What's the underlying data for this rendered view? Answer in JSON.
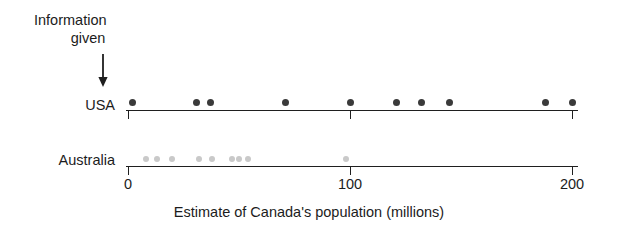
{
  "annotation": {
    "line1": "Information",
    "line2": "given",
    "arrow": "down-arrow",
    "points_to_value": 0
  },
  "rows": [
    {
      "label": "USA"
    },
    {
      "label": "Australia"
    }
  ],
  "axis": {
    "title": "Estimate of Canada's population (millions)",
    "ticks": [
      {
        "value": 0,
        "label": "0"
      },
      {
        "value": 100,
        "label": "100"
      },
      {
        "value": 200,
        "label": "200"
      }
    ],
    "min": 0,
    "max": 204
  },
  "colors": {
    "usa_dot": "#3a3a3a",
    "australia_dot": "#c9c9c9",
    "axis": "#1f1f1f",
    "text": "#1c1c1c",
    "background": "#ffffff"
  },
  "chart_data": {
    "type": "scatter",
    "title": "",
    "subtitle": "",
    "xlabel": "Estimate of Canada's population (millions)",
    "ylabel": "",
    "xlim": [
      0,
      204
    ],
    "xticks": [
      0,
      100,
      200
    ],
    "xticklabels": [
      "0",
      "100",
      "200"
    ],
    "grid": false,
    "legend": "none",
    "orientation": "horizontal-dotplot",
    "annotations": [
      {
        "text": "Information given",
        "x": 0,
        "target_series": "USA",
        "marker": "arrow-down"
      }
    ],
    "series": [
      {
        "name": "USA",
        "color": "#3a3a3a",
        "row": 0,
        "values": [
          2,
          31,
          37,
          71,
          100,
          121,
          132,
          145,
          188,
          200
        ],
        "count": 10
      },
      {
        "name": "Australia",
        "color": "#c9c9c9",
        "row": 1,
        "values": [
          8,
          13,
          20,
          32,
          38,
          47,
          50,
          54,
          98
        ],
        "count": 9
      }
    ]
  }
}
